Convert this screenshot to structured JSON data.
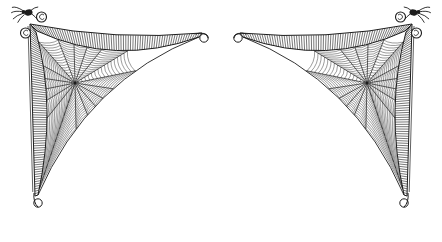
{
  "meta": {
    "background_color": "#ffffff",
    "ink_color": "#1d1d1d"
  },
  "canvas": {
    "width": 442,
    "height": 242
  },
  "webs": {
    "left": {
      "corner": [
        30,
        24
      ],
      "top_end": [
        202,
        33
      ],
      "bottom_end": [
        37,
        196
      ],
      "hub": [
        75,
        83
      ],
      "spider_corner": "top-left"
    },
    "right": {
      "mirrored_from": "left",
      "spider_corner": "top-right"
    },
    "style": {
      "spokes": 18,
      "spiral_rings": 16,
      "top_band_hatch": "vertical",
      "side_band_hatch": "horizontal",
      "tip_ornament": "scroll-curl",
      "corner_ornament": "double-curl"
    }
  }
}
